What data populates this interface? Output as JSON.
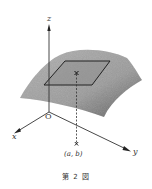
{
  "figure": {
    "caption": "第 2 図",
    "axes": {
      "z_label": "z",
      "x_label": "x",
      "y_label": "y",
      "origin_label": "O"
    },
    "point_label": "(a, b)",
    "colors": {
      "surface": "#9e9e9e",
      "surface_dark": "#6f6f6f",
      "plane": "#8c8c8c",
      "lines": "#222222"
    }
  }
}
